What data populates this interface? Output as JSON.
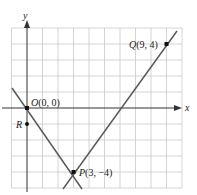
{
  "diagram": {
    "type": "coordinate-plane",
    "axes": {
      "x_label": "x",
      "y_label": "y",
      "x_range": [
        -1,
        10
      ],
      "y_range": [
        -5,
        5
      ],
      "grid": true
    },
    "points": [
      {
        "id": "O",
        "label_name": "O",
        "label_coords": "(0, 0)",
        "x": 0,
        "y": 0
      },
      {
        "id": "P",
        "label_name": "P",
        "label_coords": "(3, −4)",
        "x": 3,
        "y": -4
      },
      {
        "id": "Q",
        "label_name": "Q",
        "label_coords": "(9, 4)",
        "x": 9,
        "y": 4
      },
      {
        "id": "R",
        "label_name": "R",
        "label_coords": "",
        "x": 0,
        "y": -1
      }
    ],
    "lines": [
      {
        "id": "line-OP",
        "through": [
          "O",
          "P"
        ],
        "slope": "-4/3"
      },
      {
        "id": "line-PQ",
        "through": [
          "P",
          "Q"
        ],
        "slope": "4/3"
      }
    ],
    "colors": {
      "grid": "#c9c9c9",
      "axis": "#333333",
      "line": "#5a5a5a",
      "point": "#111111"
    }
  }
}
